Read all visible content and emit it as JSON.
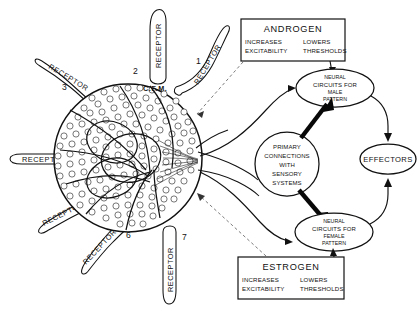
{
  "figure": {
    "background_color": "#ffffff",
    "ink_color": "#111111"
  },
  "cell_mass": {
    "label": "C.F.M.",
    "description": "common final mass of neurons"
  },
  "receptors": [
    {
      "id": "receptor-1",
      "label": "RECEPTOR",
      "number": "1"
    },
    {
      "id": "receptor-2",
      "label": "RECEPTOR",
      "number": "2"
    },
    {
      "id": "receptor-3",
      "label": "RECEPTOR",
      "number": "3"
    },
    {
      "id": "receptor-4",
      "label": "RECEPTOR",
      "number": "4"
    },
    {
      "id": "receptor-5",
      "label": "RECEPTOR",
      "number": "5"
    },
    {
      "id": "receptor-6",
      "label": "RECEPTOR",
      "number": "6"
    },
    {
      "id": "receptor-7",
      "label": "RECEPTOR",
      "number": "7"
    }
  ],
  "hormone_boxes": [
    {
      "id": "androgen-box",
      "title": "ANDROGEN",
      "effect_left": "INCREASES",
      "effect_left_2": "EXCITABILITY",
      "effect_right": "LOWERS",
      "effect_right_2": "THRESHOLDS"
    },
    {
      "id": "estrogen-box",
      "title": "ESTROGEN",
      "effect_left": "INCREASES",
      "effect_left_2": "EXCITABILITY",
      "effect_right": "LOWERS",
      "effect_right_2": "THRESHOLDS"
    }
  ],
  "nodes": {
    "primary_connections": {
      "line1": "PRIMARY",
      "line2": "CONNECTIONS",
      "line3": "WITH",
      "line4": "SENSORY",
      "line5": "SYSTEMS"
    },
    "male_circuits": {
      "line1": "NEURAL",
      "line2": "CIRCUITS FOR",
      "line3": "MALE",
      "line4": "PATTERN"
    },
    "female_circuits": {
      "line1": "NEURAL",
      "line2": "CIRCUITS FOR",
      "line3": "FEMALE",
      "line4": "PATTERN"
    },
    "effectors": {
      "label": "EFFECTORS"
    }
  }
}
